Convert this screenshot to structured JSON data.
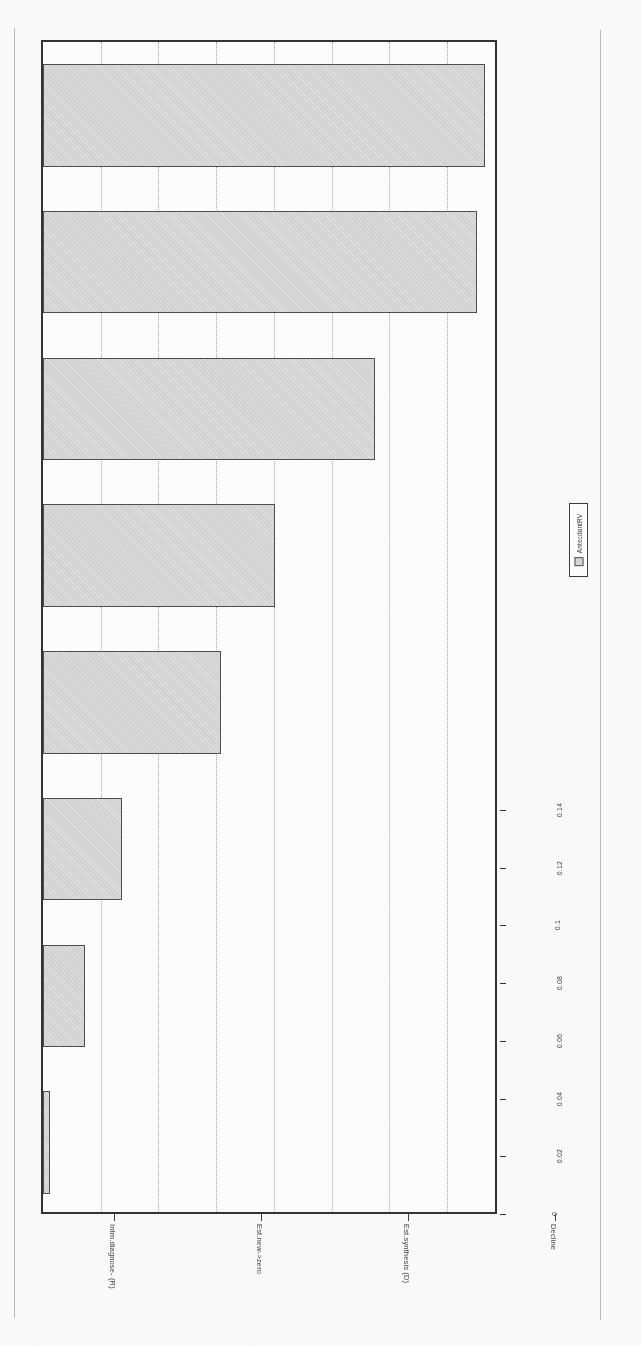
{
  "chart_data": {
    "type": "bar",
    "title": "Proximity plot",
    "orientation": "rotated-90",
    "xlabel": "",
    "ylabel": "",
    "grid": true,
    "legend_position": "right",
    "legend": [
      "AntecdantRV"
    ],
    "ylim": [
      0,
      0.158
    ],
    "yticks": [
      "0",
      "0.02",
      "0.04",
      "0.06",
      "0.08",
      "0.1",
      "0.12",
      "0.14"
    ],
    "ytick_values": [
      0,
      0.02,
      0.04,
      0.06,
      0.08,
      0.1,
      0.12,
      0.14
    ],
    "categories": [
      "Intm.diagnose- (R)",
      "Est.new->zero",
      "Est.synthesis (D)",
      "Decline",
      "SubjectRV",
      "AssistantRV",
      "Features",
      "Intm.explicate (I)"
    ],
    "values": [
      0.153,
      0.1503,
      0.1152,
      0.0805,
      0.0617,
      0.0272,
      0.0145,
      0.0023
    ]
  },
  "legend": {
    "swatch_name": "antecdantrv-swatch",
    "label": "AntecdantRV"
  },
  "colors": {
    "bar_fill": "#d2d2d2",
    "bar_stroke": "#4a4a4a",
    "frame": "#2f2f2f",
    "grid": "#9aa9bd",
    "text": "#3b3b3b"
  }
}
